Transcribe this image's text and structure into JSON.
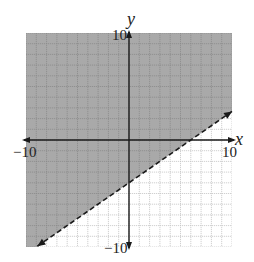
{
  "chart_data": {
    "type": "inequality-graph",
    "title": "",
    "xlabel": "x",
    "ylabel": "y",
    "xlim": [
      -10,
      10
    ],
    "ylim": [
      -10,
      10
    ],
    "grid": true,
    "grid_step": 1,
    "tick_labels": {
      "x_min": "−10",
      "x_max": "10",
      "y_min": "−10",
      "y_max": "10"
    },
    "boundary_line": {
      "equation": "y = (2/3)x - 4",
      "slope": 0.6667,
      "intercept": -4,
      "style": "dashed",
      "points": [
        [
          -8.9,
          -9.93
        ],
        [
          10,
          2.67
        ]
      ],
      "arrows": "both"
    },
    "shaded_region": "above",
    "inequality": "y > (2/3)x - 4",
    "colors": {
      "shade": "#a9a9a9",
      "shade_grid": "#8a8a8a",
      "grid": "#c4c4c4",
      "axis": "#1a1a1a",
      "line": "#1a1a1a"
    }
  }
}
